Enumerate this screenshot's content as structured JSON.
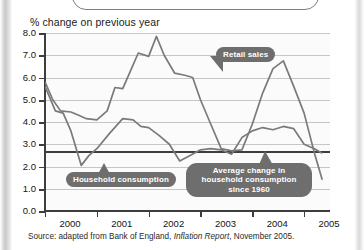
{
  "axis_title": "% change on previous year",
  "source": {
    "prefix": "Source: adapted from Bank of England, ",
    "italic": "Inflation Report",
    "suffix": ", November 2005."
  },
  "callouts": {
    "retail": "Retail sales",
    "household": "Household consumption",
    "average": "Average change in household consumption since 1960"
  },
  "colors": {
    "line": "#7a7a7a",
    "average_line": "#3d3d3d",
    "callout_bg": "#6e6e6e",
    "callout_text": "#ffffff",
    "grid": "#c6c6c6",
    "axis": "#3d3d3d",
    "plot_bg": "#fbfbfb"
  },
  "chart_data": {
    "type": "line",
    "title": "",
    "xlabel": "",
    "ylabel": "% change on previous year",
    "ylim": [
      0.0,
      8.0
    ],
    "ytick_labels": [
      "0.0",
      "1.0",
      "2.0",
      "3.0",
      "4.0",
      "5.0",
      "6.0",
      "7.0",
      "8.0"
    ],
    "yticks": [
      0.0,
      1.0,
      2.0,
      3.0,
      4.0,
      5.0,
      6.0,
      7.0,
      8.0
    ],
    "grid": true,
    "legend": "callouts",
    "xlim": [
      2000.0,
      2005.5
    ],
    "xtick_labels": [
      "2000",
      "2001",
      "2002",
      "2003",
      "2004",
      "2005"
    ],
    "xticks": [
      2000,
      2001,
      2002,
      2003,
      2004,
      2005
    ],
    "annotations": [
      {
        "label": "Retail sales",
        "points_to": [
          2003.0,
          6.0
        ]
      },
      {
        "label": "Household consumption",
        "points_to": [
          2000.7,
          2.05
        ]
      },
      {
        "label": "Average change in household consumption since 1960",
        "points_to": [
          2004.4,
          2.7
        ]
      }
    ],
    "reference_line": {
      "label": "Average change in household consumption since 1960",
      "y": 2.7
    },
    "series": [
      {
        "name": "Retail sales",
        "x": [
          2000.0,
          2000.15,
          2000.3,
          2000.5,
          2000.65,
          2000.8,
          2001.0,
          2001.2,
          2001.35,
          2001.5,
          2001.65,
          2001.8,
          2002.0,
          2002.15,
          2002.3,
          2002.5,
          2002.7,
          2002.85,
          2003.0,
          2003.2,
          2003.4,
          2003.6,
          2003.8,
          2004.0,
          2004.2,
          2004.4,
          2004.6,
          2004.8,
          2005.0,
          2005.2,
          2005.35
        ],
        "values": [
          5.8,
          5.0,
          4.5,
          4.45,
          4.3,
          4.15,
          4.1,
          4.5,
          5.55,
          5.5,
          6.3,
          7.1,
          6.95,
          7.85,
          7.0,
          6.2,
          6.1,
          6.0,
          5.0,
          3.9,
          2.8,
          2.7,
          2.75,
          3.9,
          5.3,
          6.4,
          6.75,
          5.6,
          4.4,
          2.6,
          1.4
        ]
      },
      {
        "name": "Household consumption",
        "x": [
          2000.0,
          2000.2,
          2000.35,
          2000.5,
          2000.7,
          2000.85,
          2001.0,
          2001.25,
          2001.5,
          2001.7,
          2001.85,
          2002.0,
          2002.2,
          2002.4,
          2002.6,
          2002.8,
          2003.0,
          2003.2,
          2003.4,
          2003.6,
          2003.8,
          2004.0,
          2004.2,
          2004.4,
          2004.6,
          2004.8,
          2005.0,
          2005.2,
          2005.35
        ],
        "values": [
          5.6,
          4.5,
          4.4,
          3.6,
          2.05,
          2.5,
          2.8,
          3.5,
          4.15,
          4.1,
          3.8,
          3.75,
          3.4,
          3.0,
          2.25,
          2.5,
          2.75,
          2.8,
          2.75,
          2.55,
          3.3,
          3.6,
          3.75,
          3.65,
          3.8,
          3.7,
          3.0,
          2.8,
          2.6
        ]
      }
    ]
  }
}
